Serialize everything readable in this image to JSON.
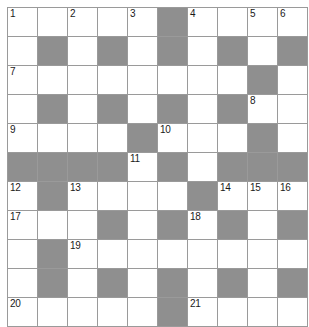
{
  "puzzle": {
    "title": "Crossword Grid",
    "type": "crossword",
    "columns": 10,
    "rows": 11,
    "cell_size_px": 29,
    "colors": {
      "background": "#ffffff",
      "cell_fill": "#ffffff",
      "block_fill": "#8f8f8f",
      "grid_line": "#9a9a9a",
      "number_text": "#1a1a1a"
    },
    "clue_numbers": [
      1,
      2,
      3,
      4,
      5,
      6,
      7,
      8,
      9,
      10,
      11,
      12,
      13,
      14,
      15,
      16,
      17,
      18,
      19,
      20,
      21
    ],
    "grid": [
      [
        {
          "block": false,
          "number": "1"
        },
        {
          "block": false,
          "number": ""
        },
        {
          "block": false,
          "number": "2"
        },
        {
          "block": false,
          "number": ""
        },
        {
          "block": false,
          "number": "3"
        },
        {
          "block": true,
          "number": ""
        },
        {
          "block": false,
          "number": "4"
        },
        {
          "block": false,
          "number": ""
        },
        {
          "block": false,
          "number": "5"
        },
        {
          "block": false,
          "number": "6"
        }
      ],
      [
        {
          "block": false,
          "number": ""
        },
        {
          "block": true,
          "number": ""
        },
        {
          "block": false,
          "number": ""
        },
        {
          "block": true,
          "number": ""
        },
        {
          "block": false,
          "number": ""
        },
        {
          "block": true,
          "number": ""
        },
        {
          "block": false,
          "number": ""
        },
        {
          "block": true,
          "number": ""
        },
        {
          "block": false,
          "number": ""
        },
        {
          "block": true,
          "number": ""
        }
      ],
      [
        {
          "block": false,
          "number": "7"
        },
        {
          "block": false,
          "number": ""
        },
        {
          "block": false,
          "number": ""
        },
        {
          "block": false,
          "number": ""
        },
        {
          "block": false,
          "number": ""
        },
        {
          "block": false,
          "number": ""
        },
        {
          "block": false,
          "number": ""
        },
        {
          "block": false,
          "number": ""
        },
        {
          "block": true,
          "number": ""
        },
        {
          "block": false,
          "number": ""
        }
      ],
      [
        {
          "block": false,
          "number": ""
        },
        {
          "block": true,
          "number": ""
        },
        {
          "block": false,
          "number": ""
        },
        {
          "block": true,
          "number": ""
        },
        {
          "block": false,
          "number": ""
        },
        {
          "block": true,
          "number": ""
        },
        {
          "block": false,
          "number": ""
        },
        {
          "block": true,
          "number": ""
        },
        {
          "block": false,
          "number": "8"
        },
        {
          "block": false,
          "number": ""
        }
      ],
      [
        {
          "block": false,
          "number": "9"
        },
        {
          "block": false,
          "number": ""
        },
        {
          "block": false,
          "number": ""
        },
        {
          "block": false,
          "number": ""
        },
        {
          "block": true,
          "number": ""
        },
        {
          "block": false,
          "number": "10"
        },
        {
          "block": false,
          "number": ""
        },
        {
          "block": false,
          "number": ""
        },
        {
          "block": true,
          "number": ""
        },
        {
          "block": false,
          "number": ""
        }
      ],
      [
        {
          "block": true,
          "number": ""
        },
        {
          "block": true,
          "number": ""
        },
        {
          "block": true,
          "number": ""
        },
        {
          "block": true,
          "number": ""
        },
        {
          "block": false,
          "number": "11"
        },
        {
          "block": true,
          "number": ""
        },
        {
          "block": false,
          "number": ""
        },
        {
          "block": true,
          "number": ""
        },
        {
          "block": true,
          "number": ""
        },
        {
          "block": true,
          "number": ""
        }
      ],
      [
        {
          "block": false,
          "number": "12"
        },
        {
          "block": true,
          "number": ""
        },
        {
          "block": false,
          "number": "13"
        },
        {
          "block": false,
          "number": ""
        },
        {
          "block": false,
          "number": ""
        },
        {
          "block": false,
          "number": ""
        },
        {
          "block": true,
          "number": ""
        },
        {
          "block": false,
          "number": "14"
        },
        {
          "block": false,
          "number": "15"
        },
        {
          "block": false,
          "number": "16"
        }
      ],
      [
        {
          "block": false,
          "number": "17"
        },
        {
          "block": false,
          "number": ""
        },
        {
          "block": false,
          "number": ""
        },
        {
          "block": true,
          "number": ""
        },
        {
          "block": false,
          "number": ""
        },
        {
          "block": true,
          "number": ""
        },
        {
          "block": false,
          "number": "18"
        },
        {
          "block": true,
          "number": ""
        },
        {
          "block": false,
          "number": ""
        },
        {
          "block": true,
          "number": ""
        }
      ],
      [
        {
          "block": false,
          "number": ""
        },
        {
          "block": true,
          "number": ""
        },
        {
          "block": false,
          "number": "19"
        },
        {
          "block": false,
          "number": ""
        },
        {
          "block": false,
          "number": ""
        },
        {
          "block": false,
          "number": ""
        },
        {
          "block": false,
          "number": ""
        },
        {
          "block": false,
          "number": ""
        },
        {
          "block": false,
          "number": ""
        },
        {
          "block": false,
          "number": ""
        }
      ],
      [
        {
          "block": false,
          "number": ""
        },
        {
          "block": true,
          "number": ""
        },
        {
          "block": false,
          "number": ""
        },
        {
          "block": true,
          "number": ""
        },
        {
          "block": false,
          "number": ""
        },
        {
          "block": true,
          "number": ""
        },
        {
          "block": false,
          "number": ""
        },
        {
          "block": true,
          "number": ""
        },
        {
          "block": false,
          "number": ""
        },
        {
          "block": true,
          "number": ""
        }
      ],
      [
        {
          "block": false,
          "number": "20"
        },
        {
          "block": false,
          "number": ""
        },
        {
          "block": false,
          "number": ""
        },
        {
          "block": false,
          "number": ""
        },
        {
          "block": false,
          "number": ""
        },
        {
          "block": true,
          "number": ""
        },
        {
          "block": false,
          "number": "21"
        },
        {
          "block": false,
          "number": ""
        },
        {
          "block": false,
          "number": ""
        },
        {
          "block": false,
          "number": ""
        }
      ]
    ]
  }
}
